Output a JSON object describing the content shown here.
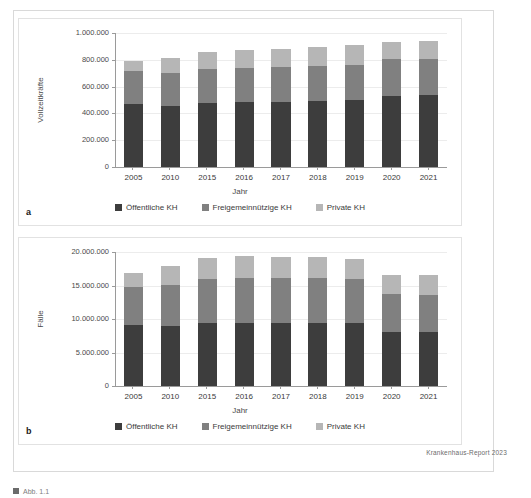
{
  "figure": {
    "source_note": "Krankenhaus-Report 2023",
    "panel_a_letter": "a",
    "panel_b_letter": "b",
    "caption_fragment": "Abb. 1.1"
  },
  "legend": {
    "items": [
      {
        "label": "Öffentliche KH",
        "color": "#3d3d3d"
      },
      {
        "label": "Freigemeinnützige KH",
        "color": "#808080"
      },
      {
        "label": "Private KH",
        "color": "#b6b6b6"
      }
    ]
  },
  "chart_data": [
    {
      "type": "bar",
      "stacked": true,
      "panel": "a",
      "title": "",
      "xlabel": "Jahr",
      "ylabel": "Vollzeitkräfte",
      "categories": [
        "2005",
        "2010",
        "2015",
        "2016",
        "2017",
        "2018",
        "2019",
        "2020",
        "2021"
      ],
      "ylim": [
        0,
        1000000
      ],
      "yticks": [
        0,
        200000,
        400000,
        600000,
        800000,
        1000000
      ],
      "ytick_labels": [
        "0",
        "200.000",
        "400.000",
        "600.000",
        "800.000",
        "1.000.000"
      ],
      "grid": true,
      "legend_position": "bottom",
      "series": [
        {
          "name": "Öffentliche KH",
          "color": "#3d3d3d",
          "values": [
            470000,
            452000,
            475000,
            482000,
            487000,
            494000,
            501000,
            531000,
            537000
          ]
        },
        {
          "name": "Freigemeinnützige KH",
          "color": "#808080",
          "values": [
            243000,
            247000,
            259000,
            259000,
            258000,
            259000,
            258000,
            272000,
            270000
          ]
        },
        {
          "name": "Private KH",
          "color": "#b6b6b6",
          "values": [
            79000,
            112000,
            126000,
            131000,
            137000,
            143000,
            148000,
            131000,
            130000
          ]
        }
      ],
      "totals": [
        792000,
        811000,
        860000,
        872000,
        882000,
        896000,
        907000,
        934000,
        937000
      ]
    },
    {
      "type": "bar",
      "stacked": true,
      "panel": "b",
      "title": "",
      "xlabel": "Jahr",
      "ylabel": "Fälle",
      "categories": [
        "2005",
        "2010",
        "2015",
        "2016",
        "2017",
        "2018",
        "2019",
        "2020",
        "2021"
      ],
      "ylim": [
        0,
        20000000
      ],
      "yticks": [
        0,
        5000000,
        10000000,
        15000000,
        20000000
      ],
      "ytick_labels": [
        "0",
        "5.000.000",
        "10.000.000",
        "15.000.000",
        "20.000.000"
      ],
      "grid": true,
      "legend_position": "bottom",
      "series": [
        {
          "name": "Öffentliche KH",
          "color": "#3d3d3d",
          "values": [
            9100000,
            9000000,
            9400000,
            9450000,
            9400000,
            9400000,
            9350000,
            8050000,
            8050000
          ]
        },
        {
          "name": "Freigemeinnützige KH",
          "color": "#808080",
          "values": [
            5750000,
            6100000,
            6500000,
            6700000,
            6700000,
            6650000,
            6550000,
            5700000,
            5600000
          ]
        },
        {
          "name": "Private KH",
          "color": "#b6b6b6",
          "values": [
            1950000,
            2800000,
            3200000,
            3250000,
            3200000,
            3150000,
            3100000,
            2850000,
            2850000
          ]
        }
      ],
      "totals": [
        16800000,
        17900000,
        19100000,
        19400000,
        19300000,
        19200000,
        19000000,
        16600000,
        16500000
      ]
    }
  ]
}
